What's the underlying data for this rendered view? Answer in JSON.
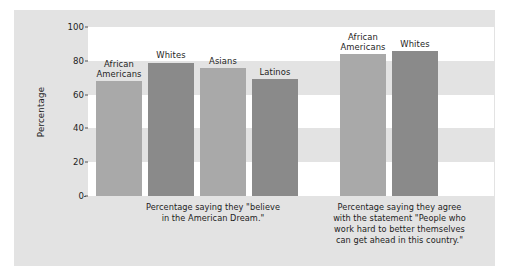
{
  "chart_data": {
    "type": "bar",
    "title": "",
    "xlabel": "",
    "ylabel": "Percentage",
    "ylim": [
      0,
      100
    ],
    "yticks": [
      0,
      20,
      40,
      60,
      80,
      100
    ],
    "grid": "horizontal white bands",
    "legend": "none (bars labelled directly)",
    "groups": [
      {
        "caption": "Percentage saying they \"believe\nin the American Dream.\"",
        "categories": [
          "African\nAmericans",
          "Whites",
          "Asians",
          "Latinos"
        ],
        "values": [
          68,
          79,
          76,
          69
        ]
      },
      {
        "caption": "Percentage saying they agree\nwith the statement \"People who\nwork hard to better themselves\ncan get ahead in this country.\"",
        "categories": [
          "African\nAmericans",
          "Whites"
        ],
        "values": [
          84,
          86
        ]
      }
    ],
    "colors": {
      "bar_light": "#a9a9a9",
      "bar_dark": "#8a8a8a",
      "panel_background": "#e3e3e3",
      "band": "#ffffff",
      "text": "#1d1d1d"
    }
  }
}
